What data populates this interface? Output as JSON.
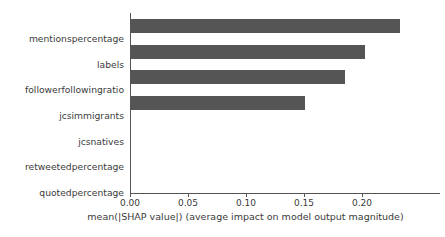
{
  "chart_data": {
    "type": "bar",
    "orientation": "horizontal",
    "title": "",
    "subtitle": "",
    "xlabel": "mean(|SHAP value|) (average impact on model output magnitude)",
    "ylabel": "",
    "categories": [
      "mentionspercentage",
      "labels",
      "followerfollowingratio",
      "jcsimmigrants",
      "jcsnatives",
      "retweetedpercentage",
      "quotedpercentage"
    ],
    "values": [
      0.233,
      0.203,
      0.185,
      0.151,
      0.0,
      0.0,
      0.0
    ],
    "xlim": [
      0.0,
      0.2672
    ],
    "xticks": [
      0.0,
      0.05,
      0.1,
      0.15,
      0.2
    ],
    "xticklabels": [
      "0.00",
      "0.05",
      "0.10",
      "0.15",
      "0.20"
    ],
    "grid": false,
    "legend": false,
    "legend_position": "none",
    "bar_color": "#555555",
    "axis_color": "#555555",
    "text_color": "#3b3b3b",
    "background_color": "#ffffff",
    "spines": [
      "left",
      "bottom"
    ]
  }
}
